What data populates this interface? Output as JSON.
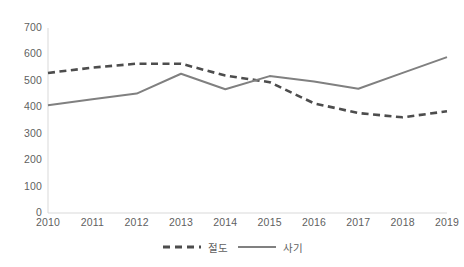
{
  "chart_data": {
    "type": "line",
    "title": "",
    "subtitle": "",
    "xlabel": "",
    "ylabel": "",
    "categories": [
      "2010",
      "2011",
      "2012",
      "2013",
      "2014",
      "2015",
      "2016",
      "2017",
      "2018",
      "2019"
    ],
    "x": [
      2010,
      2011,
      2012,
      2013,
      2014,
      2015,
      2016,
      2017,
      2018,
      2019
    ],
    "series": [
      {
        "name": "절도",
        "style": "dashed",
        "color": "#4d4d4d",
        "values": [
          530,
          550,
          565,
          565,
          520,
          495,
          415,
          378,
          362,
          385
        ]
      },
      {
        "name": "사기",
        "style": "solid",
        "color": "#808080",
        "values": [
          408,
          430,
          452,
          527,
          468,
          518,
          498,
          470,
          530,
          590
        ]
      }
    ],
    "ylim": [
      0,
      700
    ],
    "yticks": [
      0,
      100,
      200,
      300,
      400,
      500,
      600,
      700
    ],
    "ytick_labels": [
      "0",
      "100",
      "200",
      "300",
      "400",
      "500",
      "600",
      "700"
    ],
    "grid": false,
    "legend_position": "bottom"
  },
  "axes": {
    "y_axis_color": "#d9d9d9",
    "x_axis_color": "#d9d9d9",
    "tick_label_color": "#5f5f5f"
  },
  "legend": {
    "entries": [
      {
        "label": "절도",
        "style": "dashed",
        "color": "#4d4d4d"
      },
      {
        "label": "사기",
        "style": "solid",
        "color": "#808080"
      }
    ]
  }
}
